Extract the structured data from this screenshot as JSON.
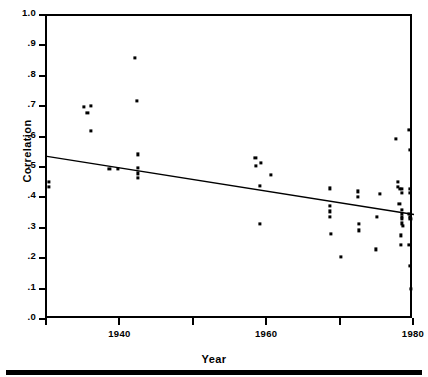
{
  "chart_data": {
    "type": "scatter",
    "title": "",
    "xlabel": "Year",
    "ylabel": "Correlation",
    "xlim": [
      1930,
      1980
    ],
    "ylim": [
      0.0,
      1.0
    ],
    "grid": false,
    "legend": "none",
    "xticks": [
      1930,
      1940,
      1950,
      1960,
      1970,
      1980
    ],
    "xticklabels": [
      "",
      "1940",
      "",
      "1960",
      "",
      "1980"
    ],
    "yticks": [
      0.0,
      0.1,
      0.2,
      0.3,
      0.4,
      0.5,
      0.6,
      0.7,
      0.8,
      0.9,
      1.0
    ],
    "yticklabels": [
      ".0",
      ".1",
      ".2",
      ".3",
      ".4",
      ".5",
      ".6",
      ".7",
      ".8",
      ".9",
      "1.0"
    ],
    "marker": "filled-square",
    "marker_color": "#000000",
    "series": [
      {
        "name": "Correlation by study year",
        "points": [
          [
            1930.3,
            0.455
          ],
          [
            1930.3,
            0.437
          ],
          [
            1935.0,
            0.701
          ],
          [
            1936.0,
            0.703
          ],
          [
            1935.5,
            0.681
          ],
          [
            1936.0,
            0.623
          ],
          [
            1938.5,
            0.497
          ],
          [
            1939.7,
            0.497
          ],
          [
            1942.0,
            0.862
          ],
          [
            1942.2,
            0.722
          ],
          [
            1942.4,
            0.545
          ],
          [
            1942.4,
            0.5
          ],
          [
            1942.4,
            0.482
          ],
          [
            1942.4,
            0.467
          ],
          [
            1958.4,
            0.533
          ],
          [
            1959.1,
            0.517
          ],
          [
            1958.5,
            0.508
          ],
          [
            1960.5,
            0.478
          ],
          [
            1959.0,
            0.442
          ],
          [
            1959.0,
            0.315
          ],
          [
            1968.5,
            0.433
          ],
          [
            1968.5,
            0.375
          ],
          [
            1968.5,
            0.357
          ],
          [
            1968.5,
            0.34
          ],
          [
            1968.7,
            0.283
          ],
          [
            1970.0,
            0.207
          ],
          [
            1972.4,
            0.423
          ],
          [
            1972.4,
            0.405
          ],
          [
            1972.5,
            0.315
          ],
          [
            1972.5,
            0.295
          ],
          [
            1975.3,
            0.415
          ],
          [
            1975.0,
            0.338
          ],
          [
            1974.8,
            0.232
          ],
          [
            1977.5,
            0.595
          ],
          [
            1977.8,
            0.455
          ],
          [
            1977.8,
            0.437
          ],
          [
            1978.1,
            0.43
          ],
          [
            1978.3,
            0.432
          ],
          [
            1978.4,
            0.418
          ],
          [
            1978.0,
            0.383
          ],
          [
            1978.3,
            0.362
          ],
          [
            1978.3,
            0.348
          ],
          [
            1978.3,
            0.34
          ],
          [
            1978.4,
            0.333
          ],
          [
            1978.3,
            0.318
          ],
          [
            1978.5,
            0.31
          ],
          [
            1978.2,
            0.278
          ],
          [
            1978.2,
            0.248
          ],
          [
            1979.3,
            0.625
          ],
          [
            1979.4,
            0.56
          ],
          [
            1979.4,
            0.432
          ],
          [
            1979.4,
            0.418
          ],
          [
            1979.3,
            0.348
          ],
          [
            1979.4,
            0.34
          ],
          [
            1979.5,
            0.333
          ],
          [
            1979.3,
            0.248
          ],
          [
            1979.4,
            0.178
          ],
          [
            1979.6,
            0.103
          ]
        ]
      }
    ],
    "fit_line": {
      "name": "least-squares regression line",
      "x_start": 1930,
      "y_start": 0.538,
      "x_end": 1980,
      "y_end": 0.347,
      "color": "#000000"
    }
  }
}
